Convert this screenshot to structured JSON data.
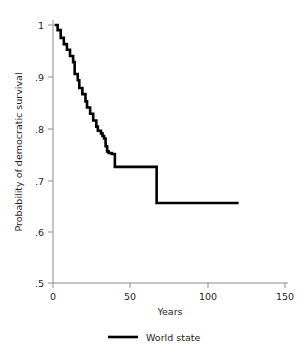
{
  "chart_data": {
    "type": "line",
    "subtype": "kaplan-meier-step",
    "title": "",
    "xlabel": "Years",
    "ylabel": "Probability of democratic survival",
    "xlim": [
      0,
      150
    ],
    "ylim": [
      0.5,
      1.0
    ],
    "xticks": [
      0,
      50,
      100,
      150
    ],
    "xtick_labels": [
      "0",
      "50",
      "100",
      "150"
    ],
    "yticks": [
      0.5,
      0.6,
      0.7,
      0.8,
      0.9,
      1.0
    ],
    "ytick_labels": [
      ".5",
      ".6",
      ".7",
      ".8",
      ".9",
      "1"
    ],
    "grid": false,
    "legend_position": "bottom-center",
    "legend": [
      "World state"
    ],
    "series": [
      {
        "name": "World state",
        "color": "#000000",
        "step": "post",
        "x": [
          1,
          3,
          5,
          7,
          9,
          11,
          13,
          14,
          16,
          17,
          19,
          21,
          22,
          24,
          26,
          28,
          29,
          31,
          32,
          33,
          34,
          35,
          36,
          38,
          40,
          67,
          120
        ],
        "y": [
          1.0,
          0.99,
          0.975,
          0.963,
          0.952,
          0.94,
          0.928,
          0.905,
          0.893,
          0.878,
          0.866,
          0.852,
          0.84,
          0.828,
          0.815,
          0.803,
          0.795,
          0.79,
          0.785,
          0.78,
          0.765,
          0.755,
          0.752,
          0.75,
          0.725,
          0.655,
          0.655
        ]
      }
    ]
  },
  "axes": {
    "x_title": "Years",
    "y_title": "Probability of democratic survival"
  },
  "legend": {
    "entries": [
      {
        "label": "World state",
        "color": "#000000"
      }
    ]
  },
  "colors": {
    "curve": "#000000",
    "axis": "#8d8d8d",
    "text": "#231f20",
    "background": "#ffffff"
  }
}
